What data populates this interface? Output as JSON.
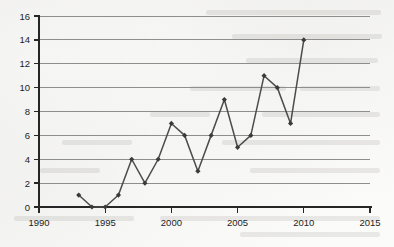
{
  "chart_data": {
    "type": "line",
    "title": "",
    "subtitle": "",
    "xlabel": "",
    "ylabel": "",
    "x": [
      1993,
      1994,
      1995,
      1996,
      1997,
      1998,
      1999,
      2000,
      2001,
      2002,
      2003,
      2004,
      2005,
      2006,
      2007,
      2008,
      2009,
      2010
    ],
    "values": [
      1,
      0,
      0,
      1,
      4,
      2,
      4,
      7,
      6,
      3,
      6,
      9,
      5,
      6,
      11,
      10,
      7,
      14
    ],
    "series": [
      {
        "name": "",
        "values": [
          1,
          0,
          0,
          1,
          4,
          2,
          4,
          7,
          6,
          3,
          6,
          9,
          5,
          6,
          11,
          10,
          7,
          14
        ]
      }
    ],
    "xlim": [
      1990,
      2015
    ],
    "ylim": [
      0,
      16
    ],
    "x_tick_labels": [
      "1990",
      "1995",
      "2000",
      "2005",
      "2010",
      "2015"
    ],
    "x_ticks": [
      1990,
      1995,
      2000,
      2005,
      2010,
      2015
    ],
    "y_tick_labels": [
      "0",
      "2",
      "4",
      "6",
      "8",
      "10",
      "12",
      "14",
      "16"
    ],
    "y_ticks": [
      0,
      2,
      4,
      6,
      8,
      10,
      12,
      14,
      16
    ],
    "grid": true,
    "grid_axis": "y",
    "legend": false,
    "legend_position": "none",
    "marker": "diamond",
    "line_color": "#4c4c4c",
    "marker_color": "#3a3a3a",
    "grid_color": "#8e8e8e",
    "axis_color": "#262626",
    "background_color": "#fbfbfa",
    "annotations": []
  }
}
